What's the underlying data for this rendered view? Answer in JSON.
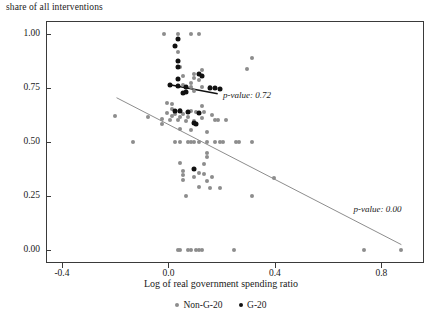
{
  "chart_data": {
    "type": "scatter",
    "title": "share of all interventions",
    "xlabel": "Log of real government spending ratio",
    "ylabel": "share of all interventions",
    "xlim": [
      -0.46,
      0.96
    ],
    "ylim": [
      -0.06,
      1.06
    ],
    "xticks": [
      "-0.4",
      "0.0",
      "0.4",
      "0.8"
    ],
    "xtick_values": [
      -0.4,
      0.0,
      0.4,
      0.8
    ],
    "yticks": [
      "0.00",
      "0.25",
      "0.50",
      "0.75",
      "1.00"
    ],
    "ytick_values": [
      0.0,
      0.25,
      0.5,
      0.75,
      1.0
    ],
    "grid": false,
    "legend_position": "bottom",
    "legend": [
      "Non-G-20",
      "G-20"
    ],
    "colors": {
      "non_g20": "#8d8d8d",
      "g20": "#111111",
      "axis": "#3a3a3a"
    },
    "annotations": [
      {
        "text": "p-value: 0.72",
        "x": 0.205,
        "y": 0.715,
        "series": "G-20"
      },
      {
        "text": "p-value: 0.00",
        "x": 0.695,
        "y": 0.185,
        "series": "Non-G-20"
      }
    ],
    "trendlines": [
      {
        "name": "G-20",
        "color": "#111111",
        "x0": 0.005,
        "y0": 0.765,
        "x1": 0.185,
        "y1": 0.723
      },
      {
        "name": "Non-G-20",
        "color": "#8d8d8d",
        "x0": -0.195,
        "y0": 0.705,
        "x1": 0.875,
        "y1": 0.025
      }
    ],
    "series": [
      {
        "name": "Non-G-20",
        "color": "#8d8d8d",
        "points": [
          [
            -0.015,
            1.0
          ],
          [
            0.035,
            1.0
          ],
          [
            0.085,
            1.0
          ],
          [
            0.115,
            1.0
          ],
          [
            0.035,
            0.915
          ],
          [
            0.035,
            0.875
          ],
          [
            0.045,
            0.845
          ],
          [
            0.125,
            0.835
          ],
          [
            0.095,
            0.815
          ],
          [
            0.055,
            0.805
          ],
          [
            0.095,
            0.795
          ],
          [
            0.115,
            0.785
          ],
          [
            0.085,
            0.775
          ],
          [
            0.055,
            0.765
          ],
          [
            0.085,
            0.755
          ],
          [
            0.125,
            0.755
          ],
          [
            0.155,
            0.755
          ],
          [
            0.095,
            0.735
          ],
          [
            0.055,
            0.725
          ],
          [
            0.315,
            0.89
          ],
          [
            0.295,
            0.84
          ],
          [
            -0.005,
            0.68
          ],
          [
            0.015,
            0.675
          ],
          [
            0.125,
            0.665
          ],
          [
            0.015,
            0.655
          ],
          [
            0.045,
            0.65
          ],
          [
            0.085,
            0.645
          ],
          [
            0.105,
            0.64
          ],
          [
            0.135,
            0.64
          ],
          [
            -0.005,
            0.635
          ],
          [
            0.025,
            0.63
          ],
          [
            0.055,
            0.63
          ],
          [
            0.165,
            0.625
          ],
          [
            0.015,
            0.62
          ],
          [
            0.045,
            0.615
          ],
          [
            0.075,
            0.615
          ],
          [
            0.125,
            0.61
          ],
          [
            -0.025,
            0.605
          ],
          [
            0.005,
            0.6
          ],
          [
            0.035,
            0.6
          ],
          [
            0.065,
            0.598
          ],
          [
            0.095,
            0.595
          ],
          [
            0.175,
            0.6
          ],
          [
            0.185,
            0.6
          ],
          [
            0.215,
            0.6
          ],
          [
            -0.2,
            0.62
          ],
          [
            -0.075,
            0.615
          ],
          [
            -0.025,
            0.585
          ],
          [
            0.145,
            0.545
          ],
          [
            0.045,
            0.56
          ],
          [
            0.085,
            0.555
          ],
          [
            0.025,
            0.5
          ],
          [
            0.045,
            0.5
          ],
          [
            0.075,
            0.5
          ],
          [
            0.085,
            0.5
          ],
          [
            0.095,
            0.5
          ],
          [
            0.115,
            0.5
          ],
          [
            0.145,
            0.5
          ],
          [
            0.175,
            0.5
          ],
          [
            0.195,
            0.5
          ],
          [
            0.205,
            0.5
          ],
          [
            0.255,
            0.5
          ],
          [
            0.265,
            0.5
          ],
          [
            0.315,
            0.5
          ],
          [
            -0.135,
            0.5
          ],
          [
            0.145,
            0.45
          ],
          [
            0.145,
            0.43
          ],
          [
            0.045,
            0.405
          ],
          [
            0.135,
            0.4
          ],
          [
            0.055,
            0.365
          ],
          [
            0.115,
            0.355
          ],
          [
            0.135,
            0.35
          ],
          [
            0.055,
            0.345
          ],
          [
            0.095,
            0.34
          ],
          [
            0.165,
            0.34
          ],
          [
            0.055,
            0.325
          ],
          [
            0.145,
            0.32
          ],
          [
            0.395,
            0.335
          ],
          [
            0.115,
            0.29
          ],
          [
            0.155,
            0.285
          ],
          [
            0.195,
            0.285
          ],
          [
            0.065,
            0.25
          ],
          [
            0.315,
            0.25
          ],
          [
            0.035,
            0.0
          ],
          [
            0.045,
            0.0
          ],
          [
            0.075,
            0.0
          ],
          [
            0.085,
            0.0
          ],
          [
            0.105,
            0.0
          ],
          [
            0.115,
            0.0
          ],
          [
            0.125,
            0.0
          ],
          [
            0.245,
            0.0
          ],
          [
            0.735,
            0.0
          ],
          [
            0.875,
            0.0
          ]
        ]
      },
      {
        "name": "G-20",
        "color": "#111111",
        "points": [
          [
            0.035,
            0.975
          ],
          [
            0.025,
            0.945
          ],
          [
            0.035,
            0.875
          ],
          [
            0.035,
            0.845
          ],
          [
            0.035,
            0.79
          ],
          [
            0.035,
            0.76
          ],
          [
            0.115,
            0.815
          ],
          [
            0.125,
            0.805
          ],
          [
            0.005,
            0.765
          ],
          [
            0.065,
            0.755
          ],
          [
            0.065,
            0.73
          ],
          [
            0.055,
            0.725
          ],
          [
            0.155,
            0.75
          ],
          [
            0.175,
            0.75
          ],
          [
            0.195,
            0.745
          ],
          [
            0.025,
            0.645
          ],
          [
            0.045,
            0.645
          ],
          [
            0.075,
            0.64
          ],
          [
            0.115,
            0.635
          ],
          [
            0.095,
            0.59
          ],
          [
            0.105,
            0.585
          ],
          [
            0.095,
            0.375
          ]
        ]
      }
    ]
  }
}
